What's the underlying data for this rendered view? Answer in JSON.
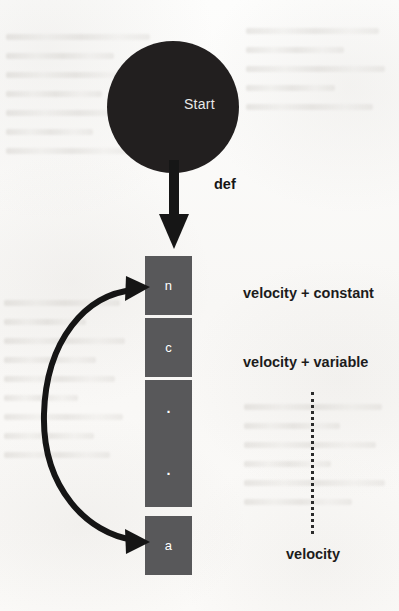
{
  "diagram": {
    "title_node": {
      "label": "Start"
    },
    "def_edge": {
      "label": "def"
    },
    "stack": {
      "cells": [
        {
          "label": "n",
          "kind": "name"
        },
        {
          "label": "c",
          "kind": "name"
        },
        {
          "label": "·",
          "kind": "ellipsis"
        },
        {
          "label": "·",
          "kind": "ellipsis"
        },
        {
          "label": "a",
          "kind": "name"
        }
      ]
    },
    "side_labels": [
      {
        "text": "velocity + constant"
      },
      {
        "text": "velocity + variable"
      }
    ],
    "velocity_label": {
      "text": "velocity"
    },
    "icons": {
      "down_arrow": "down-arrow-icon",
      "curved_double_arrow": "curved-double-arrow-icon",
      "vertical_dotted_line": "vertical-dotted-line-icon"
    },
    "colors": {
      "node_fill": "#221f1f",
      "cell_fill": "#58585a",
      "cell_text": "#ffffff",
      "ink": "#1c1c1c",
      "paper": "#fbfbfa"
    }
  }
}
